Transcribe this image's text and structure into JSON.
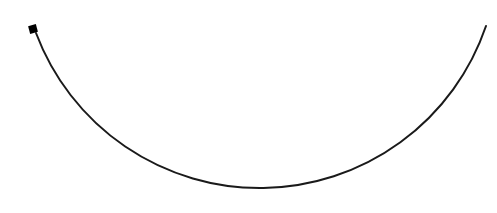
{
  "diagram": {
    "type": "arc",
    "stroke_color": "#1a1a1a",
    "stroke_width": 2,
    "arc": {
      "start": [
        36,
        33
      ],
      "end": [
        486,
        26
      ],
      "lowest_point": [
        262,
        194
      ],
      "radius": 239
    },
    "marker": {
      "shape": "square",
      "center": [
        33,
        29
      ],
      "size": 8,
      "color": "#000000"
    }
  }
}
